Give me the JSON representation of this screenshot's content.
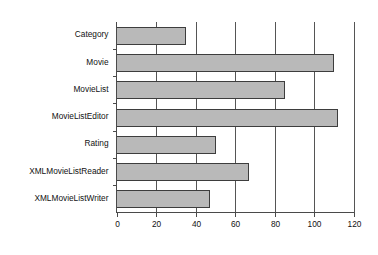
{
  "chart_data": {
    "type": "bar",
    "orientation": "horizontal",
    "title": "",
    "subtitle": "",
    "xlabel": "",
    "ylabel": "",
    "xlim": [
      0,
      120
    ],
    "xticks": [
      0,
      20,
      40,
      60,
      80,
      100,
      120
    ],
    "xtick_labels": [
      "0",
      "20",
      "40",
      "60",
      "80",
      "100",
      "120"
    ],
    "grid": true,
    "grid_axis": "x",
    "legend": false,
    "legend_position": "none",
    "categories": [
      "Category",
      "Movie",
      "MovieList",
      "MovieListEditor",
      "Rating",
      "XMLMovieListReader",
      "XMLMovieListWriter"
    ],
    "values": [
      35,
      110,
      85,
      112,
      50,
      67,
      47
    ],
    "series": [
      {
        "name": "",
        "values": [
          35,
          110,
          85,
          112,
          50,
          67,
          47
        ]
      }
    ],
    "colors": {
      "bar_fill": "#b9b9b9",
      "bar_stroke": "#3d3d3d",
      "axis": "#4a4a4a",
      "grid": "#555555",
      "text": "#111111",
      "background": "#ffffff"
    }
  }
}
